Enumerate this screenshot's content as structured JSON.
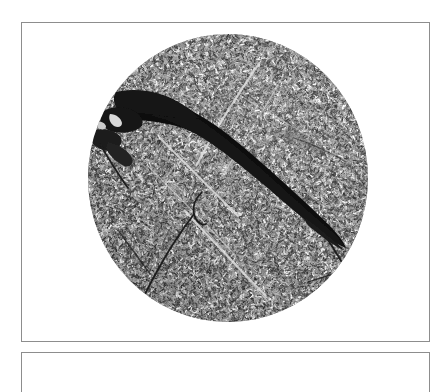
{
  "page": {
    "background_color": "#ffffff",
    "width": 448,
    "height": 358
  },
  "figure": {
    "frame_border_color": "#8d8d8d",
    "primary_panel": {
      "name": "micrograph-panel",
      "caption": "",
      "label": ""
    },
    "secondary_panel": {
      "name": "second-figure-panel",
      "caption": "",
      "label": ""
    }
  },
  "micrograph": {
    "aperture_shape": "circle",
    "field_background_color": "#9c9c9c",
    "grain_dark_color": "#4a4a4a",
    "grain_light_color": "#cfcfcf",
    "void_color": "#121212",
    "crack_color": "#1e1e1e",
    "boundary_color": "#e2e2e2",
    "center_x": 140,
    "center_y": 144,
    "radius_x": 140,
    "radius_y": 144,
    "description": "circular microscope field of view with mottled gray grain texture",
    "features": [
      {
        "name": "primary-void",
        "type": "wedge-void",
        "description": "large dark wedge-shaped fracture void running diagonally from upper-left toward lower-right, tapering to a point"
      },
      {
        "name": "upper-left-void-cluster",
        "type": "dark-blob",
        "description": "irregular dark inclusion cluster at the upper-left margin of the field"
      },
      {
        "name": "lower-left-crack",
        "type": "crack-line",
        "description": "thin dark curved crack in the lower-left quadrant"
      },
      {
        "name": "right-edge-crack",
        "type": "crack-line",
        "description": "thin dark crack branching near the right edge of the field"
      },
      {
        "name": "grain-boundaries",
        "type": "light-lines",
        "description": "faint light linear grain-boundary traces crossing the field"
      }
    ]
  }
}
